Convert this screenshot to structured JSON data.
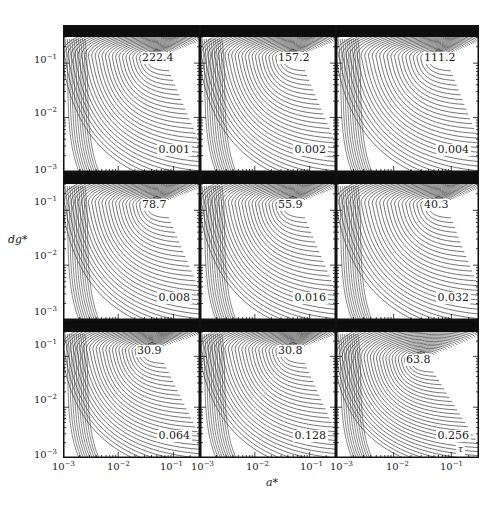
{
  "figure": {
    "xlabel": "a*",
    "ylabel": "dg*",
    "tau_symbol": "τ",
    "colors": {
      "ink": "#1a1a1a",
      "contour": "#3a3a3a",
      "band": "#0d0d0d",
      "background": "#ffffff"
    }
  },
  "chart_data": {
    "type": "contour",
    "layout": "3x3 grid of contour panels",
    "xlabel": "a*",
    "ylabel": "dg*",
    "xscale": "log",
    "yscale": "log",
    "xlim": [
      0.001,
      0.3
    ],
    "ylim": [
      0.001,
      0.3
    ],
    "x_tick_labels": [
      "10^-3",
      "10^-2",
      "10^-1"
    ],
    "y_tick_labels": [
      "10^-1",
      "10^-2",
      "10^-3"
    ],
    "grid": false,
    "legend": null,
    "panels": [
      {
        "row": 0,
        "col": 0,
        "tau": "0.001",
        "peak_value": "222.4",
        "peak_a": 0.05,
        "peak_dg": 0.12
      },
      {
        "row": 0,
        "col": 1,
        "tau": "0.002",
        "peak_value": "157.2",
        "peak_a": 0.05,
        "peak_dg": 0.12
      },
      {
        "row": 0,
        "col": 2,
        "tau": "0.004",
        "peak_value": "111.2",
        "peak_a": 0.06,
        "peak_dg": 0.12
      },
      {
        "row": 1,
        "col": 0,
        "tau": "0.008",
        "peak_value": "78.7",
        "peak_a": 0.05,
        "peak_dg": 0.12
      },
      {
        "row": 1,
        "col": 1,
        "tau": "0.016",
        "peak_value": "55.9",
        "peak_a": 0.05,
        "peak_dg": 0.12
      },
      {
        "row": 1,
        "col": 2,
        "tau": "0.032",
        "peak_value": "40.3",
        "peak_a": 0.06,
        "peak_dg": 0.12
      },
      {
        "row": 2,
        "col": 0,
        "tau": "0.064",
        "peak_value": "30.9",
        "peak_a": 0.04,
        "peak_dg": 0.12
      },
      {
        "row": 2,
        "col": 1,
        "tau": "0.128",
        "peak_value": "30.8",
        "peak_a": 0.05,
        "peak_dg": 0.12
      },
      {
        "row": 2,
        "col": 2,
        "tau": "0.256",
        "peak_value": "63.8",
        "peak_a": 0.03,
        "peak_dg": 0.08
      }
    ],
    "annotations": [
      "τ (near bottom-right of last panel)"
    ]
  },
  "axes": {
    "y_ticks": [
      {
        "base": "10",
        "exp": "−1"
      },
      {
        "base": "10",
        "exp": "−2"
      },
      {
        "base": "10",
        "exp": "−3"
      }
    ],
    "x_ticks": [
      {
        "base": "10",
        "exp": "−3"
      },
      {
        "base": "10",
        "exp": "−2"
      },
      {
        "base": "10",
        "exp": "−1"
      }
    ]
  }
}
